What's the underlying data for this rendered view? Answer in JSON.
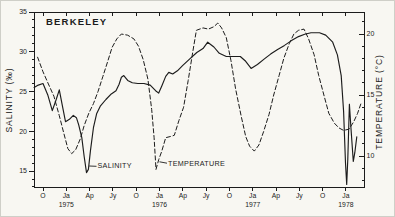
{
  "figure": {
    "kind": "scanned line chart",
    "background_color": "#f8f7f2",
    "ink_color": "#1c1c1c"
  },
  "chart_data": {
    "type": "line",
    "title": "BERKELEY",
    "x_axis": {
      "unit": "months (0 = first tick, Oct 1974)",
      "tick_positions": [
        0,
        3,
        6,
        9,
        12,
        15,
        18,
        21,
        24,
        27,
        30,
        33,
        36,
        39
      ],
      "tick_labels": [
        "O",
        "Ja",
        "Ap",
        "Jy",
        "O",
        "Ja",
        "Ap",
        "Jy",
        "O",
        "Ja",
        "Ap",
        "Jy",
        "O",
        "Ja"
      ],
      "year_labels": [
        {
          "text": "1975",
          "month": 3
        },
        {
          "text": "1976",
          "month": 15
        },
        {
          "text": "1977",
          "month": 27
        },
        {
          "text": "1978",
          "month": 39
        }
      ]
    },
    "y_left": {
      "label": "SALINITY (‰)",
      "ticks": [
        15,
        20,
        25,
        30,
        35
      ],
      "minor_range": [
        13,
        35
      ],
      "range": [
        13,
        35
      ]
    },
    "y_right": {
      "label": "TEMPERATURE (°C)",
      "ticks": [
        10,
        15,
        20
      ],
      "minor_range": [
        8,
        21
      ],
      "range": [
        7.5,
        21.8
      ]
    },
    "grid": false,
    "series": [
      {
        "name": "SALINITY",
        "style": "solid",
        "axis": "left",
        "points": [
          [
            -1.15,
            25.5
          ],
          [
            -0.6,
            25.8
          ],
          [
            0,
            26.0
          ],
          [
            0.6,
            24.6
          ],
          [
            1.2,
            22.6
          ],
          [
            1.7,
            24.0
          ],
          [
            2.1,
            25.2
          ],
          [
            2.5,
            23.2
          ],
          [
            2.9,
            21.2
          ],
          [
            3.4,
            21.5
          ],
          [
            3.9,
            22.0
          ],
          [
            4.3,
            21.7
          ],
          [
            4.6,
            20.8
          ],
          [
            5.0,
            19.2
          ],
          [
            5.3,
            16.8
          ],
          [
            5.6,
            14.8
          ],
          [
            5.85,
            15.2
          ],
          [
            6.1,
            17.5
          ],
          [
            6.5,
            20.5
          ],
          [
            6.9,
            22.2
          ],
          [
            7.4,
            23.2
          ],
          [
            8.1,
            24.0
          ],
          [
            8.8,
            24.7
          ],
          [
            9.4,
            25.1
          ],
          [
            9.8,
            25.9
          ],
          [
            10.1,
            26.8
          ],
          [
            10.4,
            27.0
          ],
          [
            10.9,
            26.4
          ],
          [
            11.5,
            26.1
          ],
          [
            12.2,
            26.0
          ],
          [
            13.0,
            26.0
          ],
          [
            13.8,
            25.8
          ],
          [
            14.5,
            25.1
          ],
          [
            14.9,
            24.8
          ],
          [
            15.3,
            25.7
          ],
          [
            15.8,
            26.9
          ],
          [
            16.2,
            27.4
          ],
          [
            16.7,
            27.2
          ],
          [
            17.3,
            27.6
          ],
          [
            18.0,
            28.3
          ],
          [
            18.9,
            29.1
          ],
          [
            19.8,
            29.9
          ],
          [
            20.6,
            30.4
          ],
          [
            21.2,
            31.2
          ],
          [
            22.0,
            30.6
          ],
          [
            22.7,
            29.8
          ],
          [
            23.6,
            29.4
          ],
          [
            24.5,
            29.4
          ],
          [
            25.4,
            29.4
          ],
          [
            26.1,
            28.8
          ],
          [
            26.8,
            27.9
          ],
          [
            27.6,
            28.4
          ],
          [
            28.5,
            29.1
          ],
          [
            29.3,
            29.7
          ],
          [
            30.2,
            30.3
          ],
          [
            31.1,
            30.8
          ],
          [
            32.0,
            31.4
          ],
          [
            32.9,
            31.9
          ],
          [
            33.7,
            32.2
          ],
          [
            34.5,
            32.4
          ],
          [
            35.6,
            32.4
          ],
          [
            36.4,
            32.1
          ],
          [
            37.3,
            31.2
          ],
          [
            37.9,
            29.6
          ],
          [
            38.4,
            27.0
          ],
          [
            38.7,
            22.5
          ],
          [
            38.95,
            16.0
          ],
          [
            39.1,
            13.3
          ],
          [
            39.25,
            16.5
          ],
          [
            39.45,
            23.4
          ],
          [
            39.65,
            20.5
          ],
          [
            39.95,
            16.2
          ],
          [
            40.15,
            17.3
          ],
          [
            40.4,
            19.3
          ]
        ]
      },
      {
        "name": "TEMPERATURE",
        "style": "dashed",
        "axis": "right",
        "points": [
          [
            -0.7,
            18.1
          ],
          [
            0,
            16.9
          ],
          [
            0.7,
            15.9
          ],
          [
            1.4,
            14.9
          ],
          [
            2.1,
            13.3
          ],
          [
            2.7,
            11.8
          ],
          [
            3.2,
            10.6
          ],
          [
            3.7,
            10.2
          ],
          [
            4.2,
            10.5
          ],
          [
            4.8,
            11.4
          ],
          [
            5.3,
            12.5
          ],
          [
            5.9,
            13.5
          ],
          [
            6.5,
            14.3
          ],
          [
            7.1,
            15.3
          ],
          [
            7.7,
            16.5
          ],
          [
            8.3,
            17.7
          ],
          [
            8.9,
            18.9
          ],
          [
            9.5,
            19.6
          ],
          [
            10.1,
            20.0
          ],
          [
            10.9,
            19.9
          ],
          [
            11.7,
            19.6
          ],
          [
            12.3,
            19.0
          ],
          [
            12.9,
            17.9
          ],
          [
            13.5,
            16.3
          ],
          [
            14.0,
            13.8
          ],
          [
            14.3,
            11.5
          ],
          [
            14.55,
            8.9
          ],
          [
            14.9,
            9.7
          ],
          [
            15.3,
            10.4
          ],
          [
            15.8,
            11.5
          ],
          [
            16.4,
            11.6
          ],
          [
            16.9,
            11.7
          ],
          [
            17.5,
            12.9
          ],
          [
            18.1,
            14.0
          ],
          [
            18.7,
            16.2
          ],
          [
            19.3,
            18.6
          ],
          [
            19.75,
            20.3
          ],
          [
            20.6,
            20.5
          ],
          [
            21.3,
            20.4
          ],
          [
            22.0,
            20.6
          ],
          [
            22.5,
            20.9
          ],
          [
            23.0,
            20.5
          ],
          [
            23.6,
            19.7
          ],
          [
            24.2,
            17.8
          ],
          [
            24.8,
            15.5
          ],
          [
            25.5,
            13.3
          ],
          [
            26.1,
            11.6
          ],
          [
            26.6,
            10.8
          ],
          [
            27.2,
            10.4
          ],
          [
            27.8,
            10.9
          ],
          [
            28.4,
            12.0
          ],
          [
            29.1,
            13.4
          ],
          [
            29.7,
            15.0
          ],
          [
            30.4,
            16.6
          ],
          [
            31.0,
            18.0
          ],
          [
            31.7,
            19.2
          ],
          [
            32.3,
            20.0
          ],
          [
            32.9,
            20.3
          ],
          [
            33.6,
            20.4
          ],
          [
            34.2,
            19.6
          ],
          [
            34.9,
            18.3
          ],
          [
            35.5,
            16.6
          ],
          [
            36.2,
            14.9
          ],
          [
            36.8,
            13.5
          ],
          [
            37.5,
            12.7
          ],
          [
            38.1,
            12.3
          ],
          [
            38.7,
            12.1
          ],
          [
            39.4,
            12.2
          ],
          [
            40.0,
            12.8
          ],
          [
            40.5,
            13.5
          ],
          [
            41.0,
            14.4
          ]
        ]
      }
    ],
    "annotations": [
      {
        "text": "SALINITY",
        "points_to": "solid curve"
      },
      {
        "text": "TEMPERATURE",
        "points_to": "dashed curve"
      }
    ],
    "legend_position": "in-plot leader labels"
  }
}
